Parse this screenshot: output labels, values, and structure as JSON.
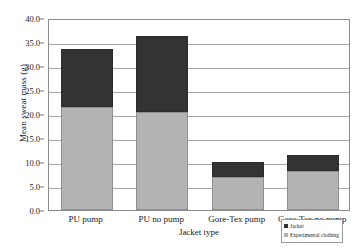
{
  "chart_data": {
    "type": "bar",
    "subtype": "stacked",
    "title": "",
    "xlabel": "Jacket type",
    "ylabel": "Mean sweat mass (g)",
    "categories": [
      "PU pump",
      "PU no pump",
      "Gore-Tex pump",
      "Gore-Tex no pump"
    ],
    "series": [
      {
        "name": "Experimental clothing",
        "color": "#b3b3b3",
        "values": [
          21.5,
          20.5,
          6.9,
          8.1
        ]
      },
      {
        "name": "Jacket",
        "color": "#333333",
        "values": [
          12.0,
          15.8,
          3.1,
          3.4
        ]
      }
    ],
    "totals": [
      33.5,
      36.3,
      10.0,
      11.5
    ],
    "ylim": [
      0.0,
      40.0
    ],
    "ytick_step": 5.0,
    "yticks": [
      "40.0",
      "35.0",
      "30.0",
      "25.0",
      "20.0",
      "15.0",
      "10.0",
      "5.0",
      "0.0"
    ],
    "grid": true,
    "grid_axis": "y",
    "legend_position": "bottom-right",
    "legend_entries": [
      "Jacket",
      "Experimental clothing"
    ]
  },
  "legend": {
    "items": [
      {
        "label": "Jacket",
        "color": "#333333"
      },
      {
        "label": "Experimental clothing",
        "color": "#b3b3b3"
      }
    ]
  },
  "colors": {
    "jacket": "#333333",
    "experimental_clothing": "#b3b3b3",
    "gridline": "#a6a6a6",
    "axis": "#8c8c8c",
    "background": "#ffffff",
    "text": "#1a1a1a"
  }
}
